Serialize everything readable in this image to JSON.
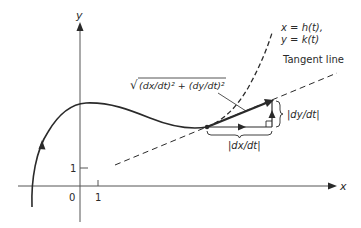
{
  "diagram": {
    "axes": {
      "x_label": "x",
      "y_label": "y",
      "origin_label": "0",
      "x_tick_label": "1",
      "y_tick_label": "1"
    },
    "curve": {
      "equation_line1": "x = h(t),",
      "equation_line2": "y = k(t)"
    },
    "tangent_line_label": "Tangent line",
    "speed_label": "√(dx/dt)² + (dy/dt)²",
    "speed_label_parts": {
      "radical": "√",
      "radicand": "(dx/dt)² + (dy/dt)²"
    },
    "horizontal_component_label": "|dx/dt|",
    "vertical_component_label": "|dy/dt|",
    "colors": {
      "stroke": "#2a2a2a",
      "axis": "#555555",
      "background": "#ffffff"
    }
  }
}
